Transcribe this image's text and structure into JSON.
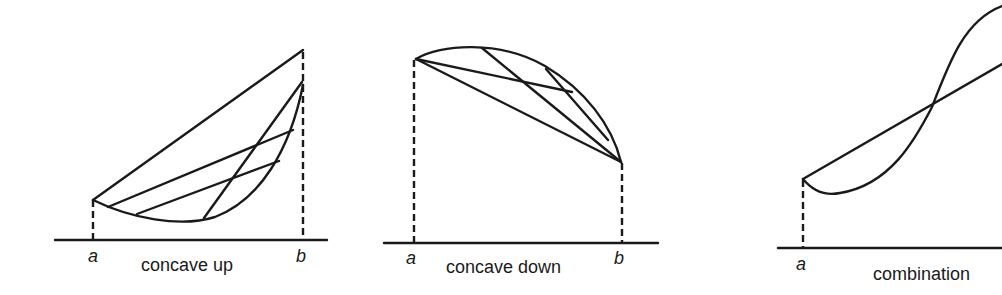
{
  "figure": {
    "background": "#ffffff",
    "ink": "#1a1a1a",
    "panels": [
      {
        "id": "concave-up",
        "caption": "concave up",
        "point_labels": {
          "a": "a",
          "b": "b"
        },
        "description": "Curve below its chords; chords lie above the graph"
      },
      {
        "id": "concave-down",
        "caption": "concave down",
        "point_labels": {
          "a": "a",
          "b": "b"
        },
        "description": "Curve above its chords; chords lie below the graph"
      },
      {
        "id": "combination",
        "caption": "combination",
        "point_labels": {
          "a": "a"
        },
        "description": "S-shaped curve crossing its chord; concave up then concave down"
      }
    ]
  }
}
